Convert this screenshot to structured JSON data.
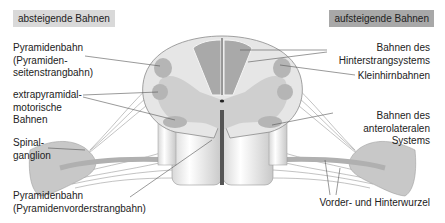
{
  "headers": {
    "left": "absteigende Bahnen",
    "right": "aufsteigende Bahnen"
  },
  "labels_left": [
    {
      "id": "pyramidenbahn-seitenstrang",
      "lines": [
        "Pyramidenbahn",
        "(Pyramiden-",
        "seitenstrangbahn)"
      ]
    },
    {
      "id": "extrapyramidal",
      "lines": [
        "extrapyramidal-",
        "motorische",
        "Bahnen"
      ]
    },
    {
      "id": "spinalganglion",
      "lines": [
        "Spinal-",
        "ganglion"
      ]
    },
    {
      "id": "pyramidenbahn-vorderstrang",
      "lines": [
        "Pyramidenbahn",
        "(Pyramidenvorderstrangbahn)"
      ]
    }
  ],
  "labels_right": [
    {
      "id": "hinterstrang",
      "lines": [
        "Bahnen des",
        "Hinterstrangsystems"
      ]
    },
    {
      "id": "kleinhirn",
      "lines": [
        "Kleinhirnbahnen"
      ]
    },
    {
      "id": "anterolateral",
      "lines": [
        "Bahnen des",
        "anterolateralen",
        "Systems"
      ]
    },
    {
      "id": "wurzel",
      "lines": [
        "Vorder- und Hinterwurzel"
      ]
    }
  ],
  "colors": {
    "white_matter": "#e8e8e8",
    "grey_matter": "#cfcfcf",
    "tract_dark": "#a9a9a9",
    "outline": "#8a8a8a",
    "leader": "#555555",
    "header_left_bg": "#d9d9d9",
    "header_right_bg": "#a8a8a8"
  }
}
